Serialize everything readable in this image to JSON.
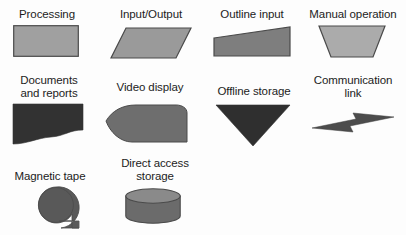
{
  "figure": {
    "kind": "flowchart-symbol-legend",
    "background_color": "#fdfdfd",
    "label_color": "#1c1c1c",
    "fill_light": "#a0a0a0",
    "fill_medium": "#8c8c8c",
    "fill_dark": "#3a3a3a",
    "fill_darker": "#2e2e2e",
    "stroke_color": "#4a4a4a",
    "rows": 3,
    "columns": 4
  },
  "symbols": [
    {
      "id": "processing",
      "label": "Processing",
      "shape": "rectangle",
      "fill": "#a0a0a0",
      "row": 1,
      "column": 1,
      "label_x": 8,
      "label_y": 8,
      "label_w": 78,
      "art_x": 13,
      "art_y": 25,
      "art_w": 66,
      "art_h": 32
    },
    {
      "id": "input-output",
      "label": "Input/Output",
      "shape": "parallelogram",
      "fill": "#9a9a9a",
      "row": 1,
      "column": 2,
      "label_x": 107,
      "label_y": 8,
      "label_w": 88,
      "art_x": 110,
      "art_y": 27,
      "art_w": 82,
      "art_h": 32
    },
    {
      "id": "outline-input",
      "label": "Outline input",
      "shape": "slanted-quadrilateral",
      "fill": "#7e7e7e",
      "row": 1,
      "column": 3,
      "label_x": 209,
      "label_y": 8,
      "label_w": 86,
      "art_x": 213,
      "art_y": 26,
      "art_w": 78,
      "art_h": 31
    },
    {
      "id": "manual-operation",
      "label": "Manual operation",
      "shape": "trapezoid-wide-top",
      "fill": "#ababab",
      "row": 1,
      "column": 4,
      "label_x": 303,
      "label_y": 8,
      "label_w": 100,
      "art_x": 318,
      "art_y": 25,
      "art_w": 68,
      "art_h": 33
    },
    {
      "id": "documents-and-reports",
      "label": "Documents\nand reports",
      "shape": "document-wavy-bottom",
      "fill": "#323232",
      "row": 2,
      "column": 1,
      "label_x": 8,
      "label_y": 74,
      "label_w": 82,
      "art_x": 13,
      "art_y": 104,
      "art_w": 70,
      "art_h": 40
    },
    {
      "id": "video-display",
      "label": "Video display",
      "shape": "display-pointed-left",
      "fill": "#6e6e6e",
      "row": 2,
      "column": 2,
      "label_x": 105,
      "label_y": 81,
      "label_w": 90,
      "art_x": 106,
      "art_y": 105,
      "art_w": 82,
      "art_h": 38
    },
    {
      "id": "offline-storage",
      "label": "Offline storage",
      "shape": "triangle-down",
      "fill": "#2f2f2f",
      "row": 2,
      "column": 3,
      "label_x": 208,
      "label_y": 85,
      "label_w": 92,
      "art_x": 216,
      "art_y": 105,
      "art_w": 74,
      "art_h": 41
    },
    {
      "id": "communication-link",
      "label": "Communication\nlink",
      "shape": "lightning-bolt",
      "fill": "#4c4c4c",
      "row": 2,
      "column": 4,
      "label_x": 303,
      "label_y": 74,
      "label_w": 100,
      "art_x": 312,
      "art_y": 112,
      "art_w": 82,
      "art_h": 22
    },
    {
      "id": "magnetic-tape",
      "label": "Magnetic tape",
      "shape": "circle-with-tab",
      "fill": "#595959",
      "row": 3,
      "column": 1,
      "label_x": 4,
      "label_y": 170,
      "label_w": 92,
      "art_x": 38,
      "art_y": 187,
      "art_w": 44,
      "art_h": 42
    },
    {
      "id": "direct-access-storage",
      "label": "Direct access\nstorage",
      "shape": "cylinder",
      "fill": "#6b6b6b",
      "row": 3,
      "column": 2,
      "label_x": 108,
      "label_y": 157,
      "label_w": 94,
      "art_x": 125,
      "art_y": 188,
      "art_w": 56,
      "art_h": 36
    }
  ]
}
